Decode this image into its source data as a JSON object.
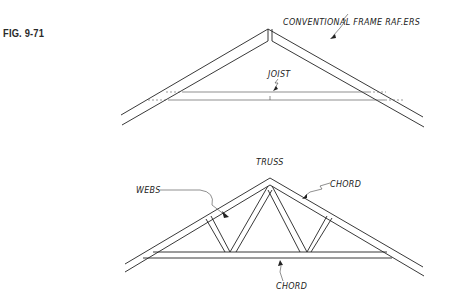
{
  "figure": {
    "label": "FIG. 9-71"
  },
  "conventional_frame": {
    "rafters_label": "CONVENTIONAL FRAME RAF.ERS",
    "joist_label": "JOIST"
  },
  "truss": {
    "title": "TRUSS",
    "webs_label": "WEBS",
    "top_chord_label": "CHORD",
    "bottom_chord_label": "CHORD"
  }
}
